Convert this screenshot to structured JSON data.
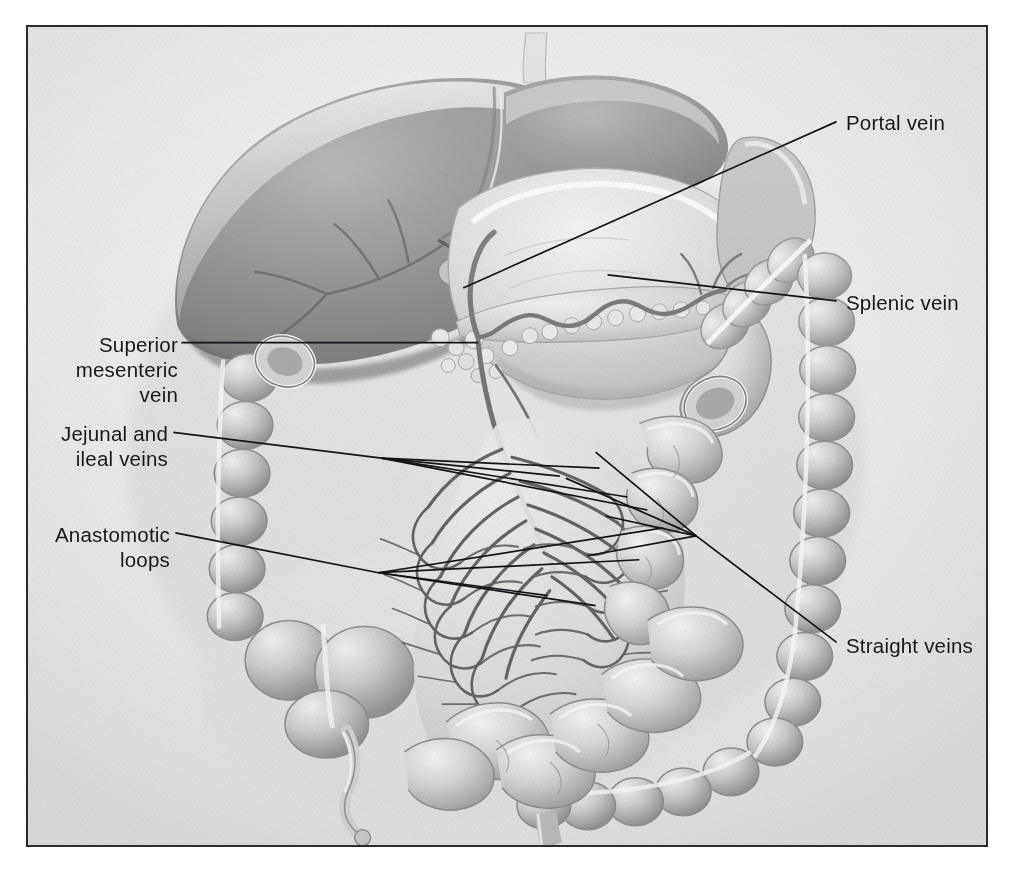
{
  "figure": {
    "kind": "anatomical-illustration",
    "rendering": "grayscale airbrush medical illustration on textured paper",
    "border_color": "#2b2b2b",
    "paper_color": "#ebebe9",
    "ink_color": "#17181a"
  },
  "labels": [
    {
      "id": "portal-vein",
      "text": "Portal vein",
      "align": "left",
      "x": 846,
      "y": 110,
      "leader": {
        "from": [
          838,
          120
        ],
        "to": [
          463,
          287
        ]
      }
    },
    {
      "id": "splenic-vein",
      "text": "Splenic vein",
      "align": "left",
      "x": 846,
      "y": 290,
      "leader": {
        "from": [
          838,
          300
        ],
        "to": [
          608,
          274
        ]
      }
    },
    {
      "id": "superior-mesenteric-vein",
      "text": "Superior\nmesenteric\nvein",
      "lines": [
        "Superior",
        "mesenteric",
        "vein"
      ],
      "align": "right",
      "x": 78,
      "y": 332,
      "width": 100,
      "leader": {
        "from": [
          180,
          342
        ],
        "to": [
          478,
          342
        ]
      }
    },
    {
      "id": "jejunal-and-ileal-veins",
      "text": "Jejunal and\nileal veins",
      "lines": [
        "Jejunal and",
        "ileal veins"
      ],
      "align": "right",
      "x": 58,
      "y": 421,
      "width": 110,
      "leader": {
        "from": [
          172,
          432
        ],
        "to": [
          381,
          458
        ]
      }
    },
    {
      "id": "anastomotic-loops",
      "text": "Anastomotic\nloops",
      "lines": [
        "Anastomotic",
        "loops"
      ],
      "align": "right",
      "x": 48,
      "y": 522,
      "width": 122,
      "leader": {
        "from": [
          174,
          533
        ],
        "to": [
          378,
          573
        ]
      }
    },
    {
      "id": "straight-veins",
      "text": "Straight veins",
      "align": "left",
      "x": 846,
      "y": 633,
      "leader": {
        "from": [
          838,
          643
        ],
        "to": [
          697,
          536
        ]
      }
    }
  ],
  "leader_fans": {
    "jejunal_ileal": {
      "node": [
        381,
        458
      ],
      "targets": [
        [
          560,
          476
        ],
        [
          600,
          468
        ],
        [
          628,
          497
        ],
        [
          648,
          510
        ]
      ]
    },
    "anastomotic": {
      "node": [
        378,
        573
      ],
      "targets": [
        [
          548,
          596
        ],
        [
          596,
          606
        ],
        [
          640,
          560
        ],
        [
          664,
          528
        ]
      ]
    },
    "straight": {
      "node": [
        697,
        536
      ],
      "targets": [
        [
          596,
          452
        ],
        [
          566,
          478
        ],
        [
          606,
          516
        ],
        [
          588,
          556
        ]
      ]
    }
  },
  "organs": [
    {
      "name": "liver",
      "tone": "#8b8b8b"
    },
    {
      "name": "gallbladder",
      "tone": "#c9c9c7"
    },
    {
      "name": "stomach",
      "tone": "#d6d6d4"
    },
    {
      "name": "pancreas",
      "tone": "#cdcdcb"
    },
    {
      "name": "duodenum",
      "tone": "#c4c4c2"
    },
    {
      "name": "transverse-colon",
      "tone": "#bdbdbb"
    },
    {
      "name": "ascending-colon",
      "tone": "#bdbdbb"
    },
    {
      "name": "descending-colon",
      "tone": "#bdbdbb"
    },
    {
      "name": "cecum",
      "tone": "#b8b8b6"
    },
    {
      "name": "appendix",
      "tone": "#cfcfcd"
    },
    {
      "name": "small-intestine",
      "tone": "#c6c6c4"
    },
    {
      "name": "mesentery",
      "tone": "#d2d2d0"
    },
    {
      "name": "sigmoid-colon",
      "tone": "#b5b5b3"
    }
  ]
}
